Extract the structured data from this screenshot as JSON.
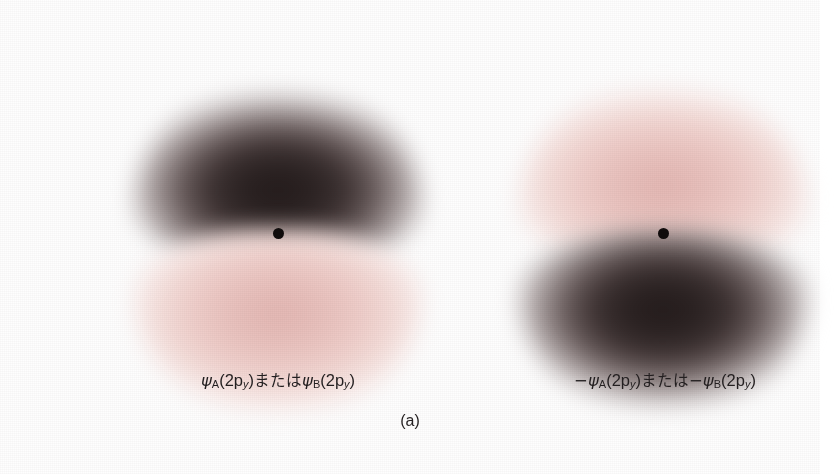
{
  "figure": {
    "panel_caption": "(a)",
    "background_color": "#ffffff",
    "dark_lobe_color": "#231b1b",
    "pink_lobe_color": "#e3b6b2",
    "nucleus_color": "#100c0c"
  },
  "orbitals": [
    {
      "id": "left",
      "label_plain": "ψA(2py)またはψB(2py)",
      "sign": "positive",
      "upper_lobe": "dark",
      "lower_lobe": "pink",
      "label_parts": {
        "psi1": "ψ",
        "sub1": "A",
        "paren1_open": "(2p",
        "sub_axis1": "y",
        "paren1_close": ")",
        "conjunction": "または",
        "psi2": "ψ",
        "sub2": "B",
        "paren2_open": "(2p",
        "sub_axis2": "y",
        "paren2_close": ")"
      }
    },
    {
      "id": "right",
      "label_plain": "−ψA(2py)または−ψB(2py)",
      "sign": "negative",
      "upper_lobe": "pink",
      "lower_lobe": "dark",
      "label_parts": {
        "minus1": "−",
        "psi1": "ψ",
        "sub1": "A",
        "paren1_open": "(2p",
        "sub_axis1": "y",
        "paren1_close": ")",
        "conjunction": "または",
        "minus2": "−",
        "psi2": "ψ",
        "sub2": "B",
        "paren2_open": "(2p",
        "sub_axis2": "y",
        "paren2_close": ")"
      }
    }
  ]
}
